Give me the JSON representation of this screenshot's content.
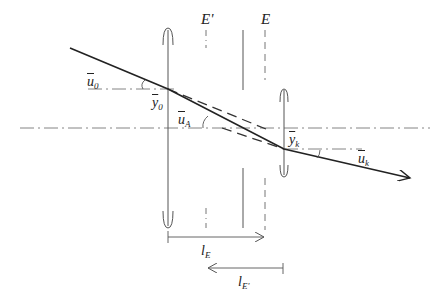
{
  "diagram": {
    "type": "optical-ray-diagram",
    "labels": {
      "u0": {
        "base": "u",
        "sub": "0"
      },
      "y0": {
        "base": "y",
        "sub": "0"
      },
      "uA": {
        "base": "u",
        "sub": "A"
      },
      "yk": {
        "base": "y",
        "sub": "k"
      },
      "uk": {
        "base": "u",
        "sub": "k"
      },
      "E_prime": "E'",
      "E": "E",
      "lE": {
        "base": "l",
        "sub": "E"
      },
      "lE_prime": {
        "base": "l",
        "sub": "E'"
      }
    },
    "colors": {
      "ray": "#222222",
      "lines": "#555555",
      "background": "#ffffff"
    }
  }
}
